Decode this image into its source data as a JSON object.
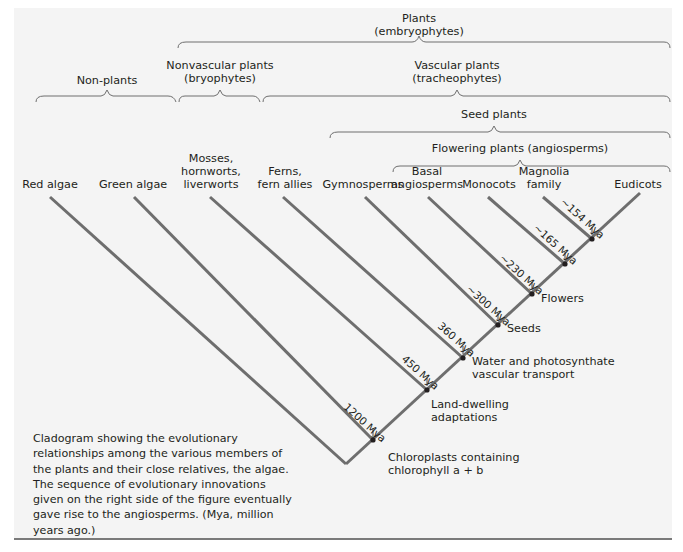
{
  "figure": {
    "background": "#f4f4f4",
    "line_color": "#6e6e6e",
    "node_color": "#231f20",
    "groups": [
      {
        "id": "plants",
        "lines": [
          "Plants",
          "(embryophytes)"
        ]
      },
      {
        "id": "non-plants",
        "lines": [
          "Non-plants"
        ]
      },
      {
        "id": "nonvascular",
        "lines": [
          "Nonvascular plants",
          "(bryophytes)"
        ]
      },
      {
        "id": "vascular",
        "lines": [
          "Vascular plants",
          "(tracheophytes)"
        ]
      },
      {
        "id": "seed",
        "lines": [
          "Seed plants"
        ]
      },
      {
        "id": "flowering",
        "lines": [
          "Flowering plants (angiosperms)"
        ]
      }
    ],
    "taxa": [
      {
        "id": "red-algae",
        "lines": [
          "Red algae"
        ]
      },
      {
        "id": "green-algae",
        "lines": [
          "Green algae"
        ]
      },
      {
        "id": "mosses",
        "lines": [
          "Mosses,",
          "hornworts,",
          "liverworts"
        ]
      },
      {
        "id": "ferns",
        "lines": [
          "Ferns,",
          "fern allies"
        ]
      },
      {
        "id": "gymnosperms",
        "lines": [
          "Gymnosperms"
        ]
      },
      {
        "id": "basal-angiosperms",
        "lines": [
          "Basal",
          "angiosperms"
        ]
      },
      {
        "id": "monocots",
        "lines": [
          "Monocots"
        ]
      },
      {
        "id": "magnolia",
        "lines": [
          "Magnolia",
          "family"
        ]
      },
      {
        "id": "eudicots",
        "lines": [
          "Eudicots"
        ]
      }
    ],
    "dates": [
      "1200 Mya",
      "450 Mya",
      "360 Mya",
      "~300 Mya",
      "~230 Mya",
      "~165 Mya",
      "~154 Mya"
    ],
    "innovations": [
      {
        "id": "chloroplasts",
        "lines": [
          "Chloroplasts containing",
          "chlorophyll a + b"
        ]
      },
      {
        "id": "land",
        "lines": [
          "Land-dwelling",
          "adaptations"
        ]
      },
      {
        "id": "water",
        "lines": [
          "Water and photosynthate",
          "vascular transport"
        ]
      },
      {
        "id": "seeds",
        "lines": [
          "Seeds"
        ]
      },
      {
        "id": "flowers",
        "lines": [
          "Flowers"
        ]
      }
    ],
    "caption": "Cladogram showing the evolutionary relationships among the various members of the plants and their close relatives, the algae. The sequence of evolutionary innovations given on the right side of the figure eventually gave rise to the angiosperms. (Mya, million years ago.)"
  }
}
